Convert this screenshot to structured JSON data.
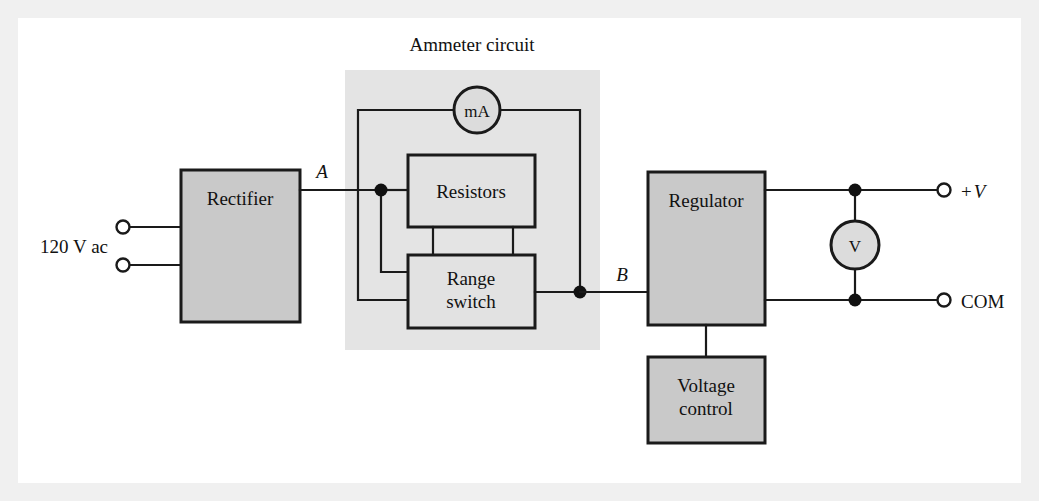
{
  "figure": {
    "title": "Ammeter circuit",
    "frame_color": "#f0f0f0",
    "canvas_color": "#ffffff",
    "block_fill": "#c9c9c9",
    "shade_fill": "#e4e4e4",
    "line_color": "#1a1a1a"
  },
  "blocks": {
    "rectifier": {
      "label": "Rectifier"
    },
    "resistors": {
      "label": "Resistors"
    },
    "range_switch": {
      "label_line1": "Range",
      "label_line2": "switch"
    },
    "regulator": {
      "label": "Regulator"
    },
    "voltage_control": {
      "label_line1": "Voltage",
      "label_line2": "control"
    }
  },
  "meters": {
    "milliammeter": {
      "label": "mA"
    },
    "voltmeter": {
      "label": "V"
    }
  },
  "labels": {
    "source": "120 V ac",
    "node_a": "A",
    "node_b": "B",
    "terminal_positive_sign": "+",
    "terminal_positive_v": "V",
    "terminal_common": "COM"
  },
  "diagram_data": {
    "type": "block-diagram",
    "description": "Block diagram of a regulated dc power supply with built-in ammeter and voltmeter",
    "nodes": [
      {
        "id": "rectifier",
        "label": "Rectifier",
        "x": 181,
        "y": 170,
        "w": 119,
        "h": 152
      },
      {
        "id": "resistors",
        "label": "Resistors",
        "x": 408,
        "y": 155,
        "w": 127,
        "h": 72
      },
      {
        "id": "range_switch",
        "label": "Range switch",
        "x": 408,
        "y": 255,
        "w": 127,
        "h": 73
      },
      {
        "id": "regulator",
        "label": "Regulator",
        "x": 648,
        "y": 172,
        "w": 117,
        "h": 153
      },
      {
        "id": "voltage_control",
        "label": "Voltage control",
        "x": 648,
        "y": 357,
        "w": 117,
        "h": 86
      },
      {
        "id": "milliammeter",
        "label": "mA",
        "cx": 477,
        "cy": 110,
        "r": 23
      },
      {
        "id": "voltmeter",
        "label": "V",
        "cx": 855,
        "cy": 245,
        "r": 24
      }
    ],
    "regions": [
      {
        "id": "ammeter_circuit",
        "label": "Ammeter circuit",
        "x": 345,
        "y": 70,
        "w": 255,
        "h": 280
      }
    ],
    "terminals": [
      {
        "id": "ac_line_1",
        "label": "120 V ac",
        "x": 122,
        "y": 227
      },
      {
        "id": "ac_line_2",
        "label": "120 V ac",
        "x": 122,
        "y": 265
      },
      {
        "id": "out_positive",
        "label": "+V",
        "x": 944,
        "y": 190
      },
      {
        "id": "out_common",
        "label": "COM",
        "x": 944,
        "y": 300
      }
    ],
    "junctions": [
      {
        "id": "node_a",
        "label": "A",
        "x": 381,
        "y": 190
      },
      {
        "id": "node_b",
        "label": "B",
        "x": 580,
        "y": 292
      },
      {
        "id": "v_top",
        "label": "",
        "x": 855,
        "y": 190
      },
      {
        "id": "v_bottom",
        "label": "",
        "x": 855,
        "y": 300
      }
    ],
    "edges": [
      {
        "from": "ac_line_1",
        "to": "rectifier"
      },
      {
        "from": "ac_line_2",
        "to": "rectifier"
      },
      {
        "from": "rectifier",
        "to": "node_a"
      },
      {
        "from": "node_a",
        "to": "resistors"
      },
      {
        "from": "node_a",
        "to": "range_switch"
      },
      {
        "from": "node_a",
        "to": "milliammeter"
      },
      {
        "from": "milliammeter",
        "to": "node_b"
      },
      {
        "from": "resistors",
        "to": "range_switch"
      },
      {
        "from": "range_switch",
        "to": "node_b"
      },
      {
        "from": "node_b",
        "to": "regulator"
      },
      {
        "from": "regulator",
        "to": "out_positive"
      },
      {
        "from": "regulator",
        "to": "out_common"
      },
      {
        "from": "v_top",
        "to": "voltmeter"
      },
      {
        "from": "voltmeter",
        "to": "v_bottom"
      },
      {
        "from": "regulator",
        "to": "voltage_control"
      }
    ]
  }
}
